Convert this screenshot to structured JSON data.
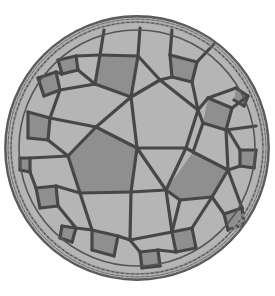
{
  "diagram": {
    "type": "hyperbolic-tiling-poincare-disk",
    "disk": {
      "cx": 137,
      "cy": 148,
      "r": 133
    },
    "colors": {
      "background": "#ffffff",
      "light_tile": "#b5b5b5",
      "dark_tile": "#8f8f8f",
      "edge": "#474747",
      "rim": "#5a5a5a",
      "rim_band": "#a8a8a8"
    }
  }
}
